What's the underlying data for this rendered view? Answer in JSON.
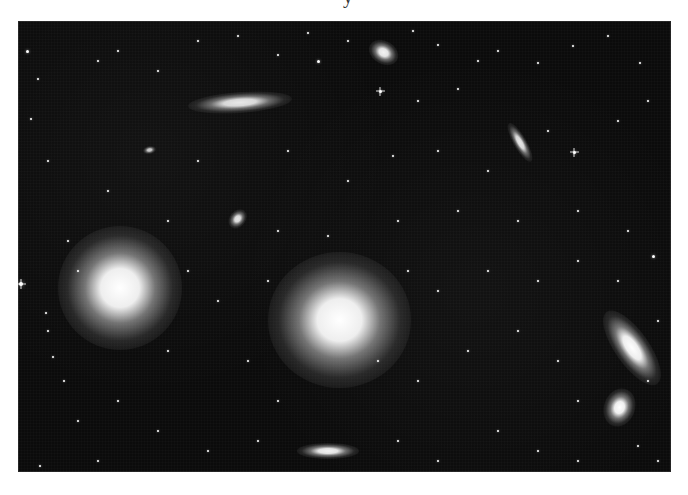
{
  "page": {
    "clipped_heading_fragment": "y"
  },
  "photo": {
    "subject": "field of galaxies against a starry black sky",
    "background_color": "#0b0b0b",
    "galaxies": [
      {
        "id": "edge-on-top-left",
        "cx": 222,
        "cy": 81,
        "rx": 40,
        "ry": 8,
        "rotate": -4,
        "brightness": 0.9
      },
      {
        "id": "small-top-center",
        "cx": 366,
        "cy": 32,
        "rx": 12,
        "ry": 9,
        "rotate": 30,
        "brightness": 0.95
      },
      {
        "id": "edge-on-upper-right",
        "cx": 502,
        "cy": 121,
        "rx": 17,
        "ry": 5,
        "rotate": 60,
        "brightness": 0.9
      },
      {
        "id": "tiny-left",
        "cx": 131,
        "cy": 129,
        "rx": 5,
        "ry": 3,
        "rotate": -10,
        "brightness": 0.8
      },
      {
        "id": "small-oval-center-left",
        "cx": 219,
        "cy": 198,
        "rx": 8,
        "ry": 6,
        "rotate": -50,
        "brightness": 0.9
      },
      {
        "id": "giant-elliptical-left",
        "cx": 102,
        "cy": 267,
        "rx": 48,
        "ry": 48,
        "rotate": 0,
        "brightness": 1.0
      },
      {
        "id": "giant-elliptical-center",
        "cx": 321,
        "cy": 299,
        "rx": 55,
        "ry": 52,
        "rotate": 0,
        "brightness": 1.0
      },
      {
        "id": "interacting-pair-upper",
        "cx": 614,
        "cy": 327,
        "rx": 34,
        "ry": 13,
        "rotate": 55,
        "brightness": 1.0
      },
      {
        "id": "interacting-pair-lower",
        "cx": 602,
        "cy": 386,
        "rx": 12,
        "ry": 15,
        "rotate": 20,
        "brightness": 1.0
      },
      {
        "id": "edge-on-bottom",
        "cx": 310,
        "cy": 430,
        "rx": 24,
        "ry": 6,
        "rotate": 0,
        "brightness": 0.95
      }
    ],
    "stars": [
      {
        "x": 9,
        "y": 30,
        "s": 3
      },
      {
        "x": 20,
        "y": 58,
        "s": 2
      },
      {
        "x": 13,
        "y": 98,
        "s": 2
      },
      {
        "x": 30,
        "y": 140,
        "s": 2
      },
      {
        "x": 3,
        "y": 263,
        "s": 4,
        "cross": true
      },
      {
        "x": 50,
        "y": 220,
        "s": 2
      },
      {
        "x": 28,
        "y": 292,
        "s": 2
      },
      {
        "x": 35,
        "y": 336,
        "s": 2
      },
      {
        "x": 46,
        "y": 360,
        "s": 2
      },
      {
        "x": 22,
        "y": 445,
        "s": 2
      },
      {
        "x": 80,
        "y": 40,
        "s": 2
      },
      {
        "x": 100,
        "y": 30,
        "s": 2
      },
      {
        "x": 140,
        "y": 50,
        "s": 2
      },
      {
        "x": 180,
        "y": 20,
        "s": 2
      },
      {
        "x": 220,
        "y": 15,
        "s": 2
      },
      {
        "x": 260,
        "y": 34,
        "s": 2
      },
      {
        "x": 300,
        "y": 40,
        "s": 3
      },
      {
        "x": 290,
        "y": 12,
        "s": 2
      },
      {
        "x": 330,
        "y": 20,
        "s": 2
      },
      {
        "x": 395,
        "y": 10,
        "s": 2
      },
      {
        "x": 420,
        "y": 24,
        "s": 2
      },
      {
        "x": 460,
        "y": 40,
        "s": 2
      },
      {
        "x": 362,
        "y": 70,
        "s": 3,
        "cross": true
      },
      {
        "x": 400,
        "y": 80,
        "s": 2
      },
      {
        "x": 440,
        "y": 68,
        "s": 2
      },
      {
        "x": 480,
        "y": 30,
        "s": 2
      },
      {
        "x": 520,
        "y": 42,
        "s": 2
      },
      {
        "x": 555,
        "y": 25,
        "s": 2
      },
      {
        "x": 590,
        "y": 15,
        "s": 2
      },
      {
        "x": 622,
        "y": 42,
        "s": 2
      },
      {
        "x": 630,
        "y": 80,
        "s": 2
      },
      {
        "x": 600,
        "y": 100,
        "s": 2
      },
      {
        "x": 556,
        "y": 131,
        "s": 3,
        "cross": true
      },
      {
        "x": 530,
        "y": 110,
        "s": 2
      },
      {
        "x": 470,
        "y": 150,
        "s": 2
      },
      {
        "x": 420,
        "y": 130,
        "s": 2
      },
      {
        "x": 375,
        "y": 135,
        "s": 2
      },
      {
        "x": 330,
        "y": 160,
        "s": 2
      },
      {
        "x": 270,
        "y": 130,
        "s": 2
      },
      {
        "x": 180,
        "y": 140,
        "s": 2
      },
      {
        "x": 90,
        "y": 170,
        "s": 2
      },
      {
        "x": 150,
        "y": 200,
        "s": 2
      },
      {
        "x": 260,
        "y": 210,
        "s": 2
      },
      {
        "x": 310,
        "y": 215,
        "s": 2
      },
      {
        "x": 380,
        "y": 200,
        "s": 2
      },
      {
        "x": 440,
        "y": 190,
        "s": 2
      },
      {
        "x": 500,
        "y": 200,
        "s": 2
      },
      {
        "x": 560,
        "y": 190,
        "s": 2
      },
      {
        "x": 610,
        "y": 210,
        "s": 2
      },
      {
        "x": 635,
        "y": 235,
        "s": 3
      },
      {
        "x": 600,
        "y": 260,
        "s": 2
      },
      {
        "x": 560,
        "y": 240,
        "s": 2
      },
      {
        "x": 520,
        "y": 260,
        "s": 2
      },
      {
        "x": 470,
        "y": 250,
        "s": 2
      },
      {
        "x": 420,
        "y": 270,
        "s": 2
      },
      {
        "x": 390,
        "y": 250,
        "s": 2
      },
      {
        "x": 250,
        "y": 260,
        "s": 2
      },
      {
        "x": 200,
        "y": 280,
        "s": 2
      },
      {
        "x": 170,
        "y": 250,
        "s": 2
      },
      {
        "x": 60,
        "y": 250,
        "s": 2
      },
      {
        "x": 30,
        "y": 310,
        "s": 2
      },
      {
        "x": 150,
        "y": 330,
        "s": 2
      },
      {
        "x": 230,
        "y": 340,
        "s": 2
      },
      {
        "x": 260,
        "y": 380,
        "s": 2
      },
      {
        "x": 360,
        "y": 340,
        "s": 2
      },
      {
        "x": 400,
        "y": 360,
        "s": 2
      },
      {
        "x": 450,
        "y": 330,
        "s": 2
      },
      {
        "x": 500,
        "y": 310,
        "s": 2
      },
      {
        "x": 540,
        "y": 340,
        "s": 2
      },
      {
        "x": 560,
        "y": 380,
        "s": 2
      },
      {
        "x": 640,
        "y": 300,
        "s": 2
      },
      {
        "x": 630,
        "y": 360,
        "s": 2
      },
      {
        "x": 100,
        "y": 380,
        "s": 2
      },
      {
        "x": 60,
        "y": 400,
        "s": 2
      },
      {
        "x": 140,
        "y": 410,
        "s": 2
      },
      {
        "x": 190,
        "y": 430,
        "s": 2
      },
      {
        "x": 240,
        "y": 420,
        "s": 2
      },
      {
        "x": 380,
        "y": 420,
        "s": 2
      },
      {
        "x": 420,
        "y": 440,
        "s": 2
      },
      {
        "x": 480,
        "y": 410,
        "s": 2
      },
      {
        "x": 520,
        "y": 430,
        "s": 2
      },
      {
        "x": 560,
        "y": 440,
        "s": 2
      },
      {
        "x": 620,
        "y": 425,
        "s": 2
      },
      {
        "x": 640,
        "y": 440,
        "s": 2
      },
      {
        "x": 80,
        "y": 440,
        "s": 2
      }
    ]
  }
}
